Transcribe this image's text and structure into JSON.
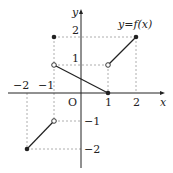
{
  "figure": {
    "function_label": "y=f(x)",
    "axis_x_label": "x",
    "axis_y_label": "y",
    "origin_label": "O",
    "x_ticks": [
      "−2",
      "−1",
      "1",
      "2"
    ],
    "y_ticks": [
      "2",
      "1",
      "−1",
      "−2"
    ],
    "segments": [
      {
        "from": [
          -2,
          -2
        ],
        "to": [
          -1,
          -1
        ],
        "from_closed": true,
        "to_closed": false
      },
      {
        "from": [
          -1,
          1
        ],
        "to": [
          1,
          0
        ],
        "from_closed": false,
        "to_closed": true
      },
      {
        "from": [
          1,
          1
        ],
        "to": [
          2,
          2
        ],
        "from_closed": false,
        "to_closed": true
      }
    ],
    "isolated_points": [
      [
        -1,
        2
      ]
    ],
    "colors": {
      "line": "#222222",
      "dashed": "#888888",
      "axis": "#222222"
    }
  }
}
